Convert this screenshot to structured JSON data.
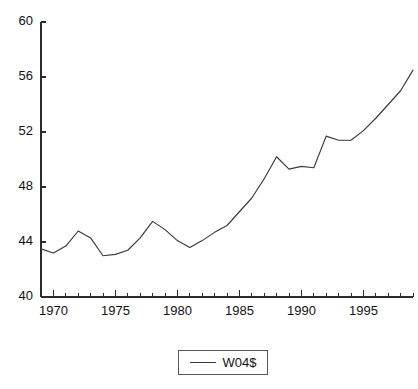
{
  "chart_data": {
    "type": "line",
    "title": "",
    "subtitle": "",
    "xlabel": "",
    "ylabel": "",
    "xlim": [
      1969,
      1999
    ],
    "ylim": [
      40,
      60
    ],
    "grid": false,
    "legend_position": "bottom-center",
    "y_ticks": [
      40,
      44,
      48,
      52,
      56,
      60
    ],
    "y_tick_labels": [
      "40",
      "44",
      "48",
      "52",
      "56",
      "60"
    ],
    "x_ticks": [
      1970,
      1975,
      1980,
      1985,
      1990,
      1995
    ],
    "x_tick_labels": [
      "1970",
      "1975",
      "1980",
      "1985",
      "1990",
      "1995"
    ],
    "x_minor_tick_step": 1,
    "series": [
      {
        "name": "W04$",
        "color": "#3a3a3a",
        "x": [
          1969,
          1970,
          1971,
          1972,
          1973,
          1974,
          1975,
          1976,
          1977,
          1978,
          1979,
          1980,
          1981,
          1982,
          1983,
          1984,
          1985,
          1986,
          1987,
          1988,
          1989,
          1990,
          1991,
          1992,
          1993,
          1994,
          1995,
          1996,
          1997,
          1998,
          1999
        ],
        "values": [
          43.5,
          43.2,
          43.7,
          44.8,
          44.3,
          43.0,
          43.1,
          43.4,
          44.3,
          45.5,
          44.9,
          44.1,
          43.6,
          44.1,
          44.7,
          45.2,
          46.2,
          47.2,
          48.6,
          50.2,
          49.3,
          49.5,
          49.4,
          51.7,
          51.4,
          51.4,
          52.1,
          53.0,
          54.0,
          55.0,
          56.5
        ]
      }
    ]
  },
  "legend": {
    "entries": [
      {
        "label": "W04$",
        "swatch": "line-swatch"
      }
    ]
  },
  "axes": {
    "y_axis_name": "value-axis",
    "x_axis_name": "year-axis"
  }
}
